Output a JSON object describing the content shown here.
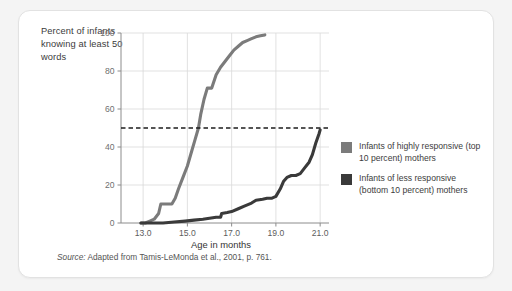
{
  "figure": {
    "y_axis_title": "Percent of infants knowing at least 50 words",
    "x_axis_title": "Age in months",
    "source_label": "Source:",
    "source_text": " Adapted from Tamis-LeMonda et al., 2001, p. 761."
  },
  "legend": {
    "items": [
      {
        "label": "Infants of highly responsive (top 10 percent) mothers",
        "color": "#7b7b7b"
      },
      {
        "label": "Infants of less responsive (bottom 10 percent) mothers",
        "color": "#3a3a3a"
      }
    ]
  },
  "chart_data": {
    "type": "line",
    "title": "",
    "xlabel": "Age in months",
    "ylabel": "Percent of infants knowing at least 50 words",
    "xlim": [
      12.0,
      21.4
    ],
    "ylim": [
      0,
      100
    ],
    "xticks": [
      "13.0",
      "15.0",
      "17.0",
      "19.0",
      "21.0"
    ],
    "xtick_values": [
      13.0,
      15.0,
      17.0,
      19.0,
      21.0
    ],
    "yticks": [
      "0",
      "20",
      "40",
      "60",
      "80",
      "100"
    ],
    "ytick_values": [
      0,
      20,
      40,
      60,
      80,
      100
    ],
    "grid": true,
    "legend_position": "right",
    "reference_line": {
      "y": 50,
      "style": "dashed",
      "color": "#1c1c1c",
      "label": "50 percent threshold"
    },
    "series": [
      {
        "name": "Infants of highly responsive (top 10 percent) mothers",
        "color": "#7b7b7b",
        "x": [
          12.9,
          13.1,
          13.3,
          13.5,
          13.7,
          13.8,
          14.0,
          14.3,
          14.45,
          14.6,
          14.8,
          15.0,
          15.2,
          15.35,
          15.5,
          15.6,
          15.75,
          15.9,
          16.1,
          16.3,
          16.5,
          16.7,
          16.9,
          17.1,
          17.3,
          17.5,
          17.7,
          17.9,
          18.1,
          18.3,
          18.5
        ],
        "y": [
          0,
          0,
          1,
          2,
          5,
          10,
          10,
          10,
          13,
          18,
          24,
          30,
          38,
          44,
          50,
          57,
          65,
          71,
          71,
          78,
          82,
          85,
          88,
          91,
          93,
          95,
          96,
          97,
          98,
          98.5,
          99
        ]
      },
      {
        "name": "Infants of less responsive (bottom 10 percent) mothers",
        "color": "#3a3a3a",
        "x": [
          12.9,
          13.4,
          13.9,
          14.4,
          14.9,
          15.3,
          15.7,
          16.0,
          16.3,
          16.5,
          16.55,
          16.8,
          17.0,
          17.3,
          17.6,
          17.9,
          18.1,
          18.4,
          18.6,
          18.8,
          19.0,
          19.2,
          19.35,
          19.5,
          19.7,
          19.9,
          20.1,
          20.3,
          20.5,
          20.65,
          20.8,
          20.95,
          21.0
        ],
        "y": [
          0,
          0,
          0,
          0.5,
          1,
          1.5,
          2,
          2.5,
          3,
          3,
          5,
          5.5,
          6,
          7.5,
          9,
          10.5,
          12,
          12.5,
          13,
          13,
          14,
          18,
          22,
          24,
          25,
          25,
          26,
          29,
          32,
          36,
          42,
          47,
          49
        ]
      }
    ]
  }
}
